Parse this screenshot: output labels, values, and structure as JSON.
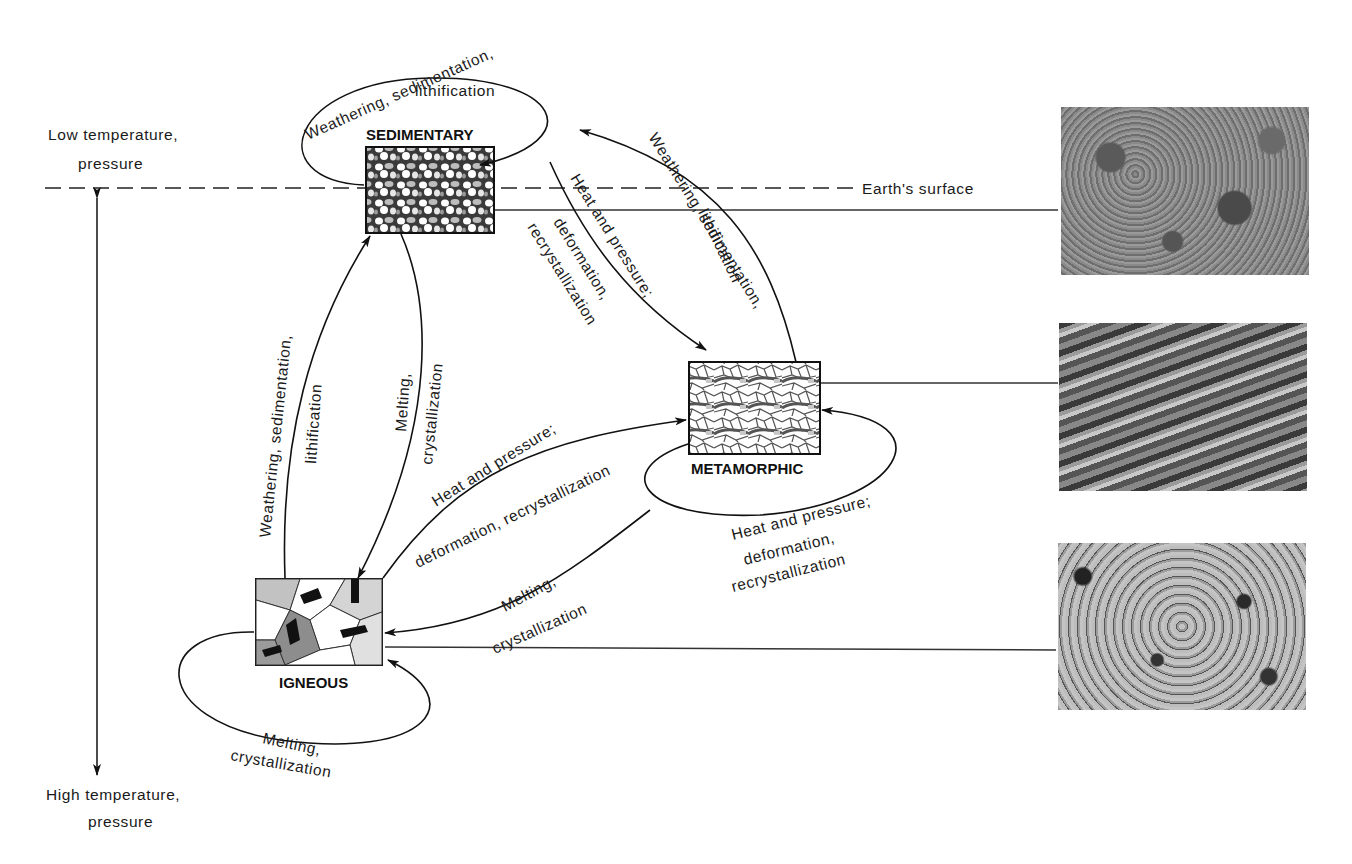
{
  "diagram": {
    "axis": {
      "top_label_line1": "Low temperature,",
      "top_label_line2": "pressure",
      "bottom_label_line1": "High temperature,",
      "bottom_label_line2": "pressure",
      "surface_label": "Earth's surface"
    },
    "rocks": [
      {
        "id": "sedimentary",
        "label": "SEDIMENTARY"
      },
      {
        "id": "metamorphic",
        "label": "METAMORPHIC"
      },
      {
        "id": "igneous",
        "label": "IGNEOUS"
      }
    ],
    "processes": {
      "sed_self_line1": "Weathering, sedimentation,",
      "sed_self_line2": "lithification",
      "sed_to_met_line1": "Heat and pressure;",
      "sed_to_met_line2": "deformation,",
      "sed_to_met_line3": "recrystallization",
      "met_to_sed_line1": "Weathering, sedimentation,",
      "met_to_sed_line2": "lithification",
      "ign_to_sed_line1": "Weathering, sedimentation,",
      "ign_to_sed_line2": "lithification",
      "sed_to_ign_line1": "Melting,",
      "sed_to_ign_line2": "crystallization",
      "ign_to_met_line1": "Heat and pressure;",
      "ign_to_met_line2": "deformation, recrystallization",
      "met_self_line1": "Heat and pressure;",
      "met_self_line2": "deformation,",
      "met_self_line3": "recrystallization",
      "met_to_ign_line1": "Melting,",
      "met_to_ign_line2": "crystallization",
      "ign_self_line1": "Melting,",
      "ign_self_line2": "crystallization"
    },
    "photos": [
      {
        "id": "sandstone-photo",
        "rock": "sedimentary"
      },
      {
        "id": "gneiss-photo",
        "rock": "metamorphic"
      },
      {
        "id": "granite-photo",
        "rock": "igneous"
      }
    ]
  }
}
